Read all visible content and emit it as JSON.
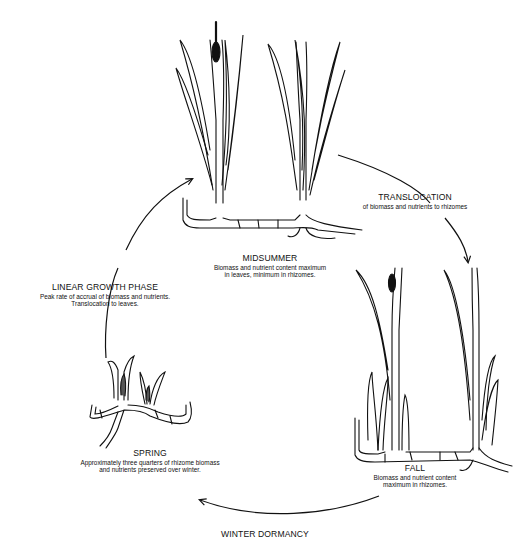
{
  "diagram": {
    "type": "cycle",
    "colors": {
      "ink": "#111111",
      "background": "#ffffff"
    },
    "stages": [
      {
        "id": "midsummer",
        "title": "MIDSUMMER",
        "desc_lines": [
          "Biomass and nutrient content maximum",
          "in leaves, minimum in rhizomes."
        ]
      },
      {
        "id": "translocation",
        "title": "TRANSLOCATION",
        "desc_lines": [
          "of biomass and nutrients to rhizomes"
        ]
      },
      {
        "id": "fall",
        "title": "FALL",
        "desc_lines": [
          "Biomass and nutrient content",
          "maximum in rhizomes."
        ]
      },
      {
        "id": "winter",
        "title": "WINTER DORMANCY",
        "desc_lines": []
      },
      {
        "id": "spring",
        "title": "SPRING",
        "desc_lines": [
          "Approximately three quarters of rhizome biomass",
          "and nutrients preserved over winter."
        ]
      },
      {
        "id": "linear-growth",
        "title": "LINEAR GROWTH PHASE",
        "desc_lines": [
          "Peak rate of accrual of biomass and nutrients.",
          "Translocation to leaves."
        ]
      }
    ],
    "arrows": [
      {
        "from": "midsummer",
        "to": "fall",
        "via": "translocation"
      },
      {
        "from": "fall",
        "to": "spring",
        "via": "winter"
      },
      {
        "from": "spring",
        "to": "midsummer",
        "via": "linear-growth"
      }
    ],
    "illustrations": [
      {
        "stage": "midsummer",
        "icon": "tall-cattail-plants-with-flower-spike-icon"
      },
      {
        "stage": "fall",
        "icon": "senescing-cattail-plants-with-new-shoots-icon"
      },
      {
        "stage": "spring",
        "icon": "young-cattail-shoots-on-rhizome-icon"
      }
    ]
  }
}
